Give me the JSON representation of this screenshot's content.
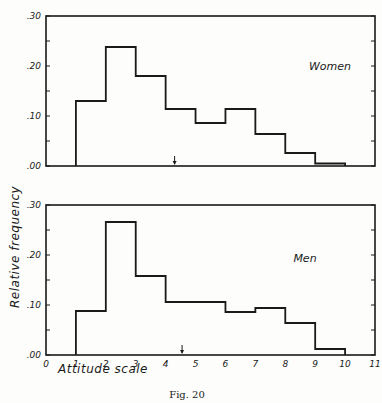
{
  "chart_data": {
    "type": "bar",
    "subtype": "step-histogram",
    "caption": "Fig. 20",
    "xlabel": "Attitude scale",
    "ylabel": "Relative frequency",
    "x_ticks": [
      "0",
      "1",
      "2",
      "3",
      "4",
      "5",
      "6",
      "7",
      "8",
      "9",
      "10",
      "11"
    ],
    "xlim": [
      0,
      11
    ],
    "y_ticks": [
      ".00",
      ".10",
      ".20",
      ".30"
    ],
    "ylim": [
      0,
      0.3
    ],
    "grid": false,
    "panels": [
      {
        "name": "Women",
        "label": "Women",
        "bin_edges": [
          1,
          2,
          3,
          4,
          5,
          6,
          7,
          8,
          9,
          10
        ],
        "values": [
          0.13,
          0.238,
          0.18,
          0.114,
          0.086,
          0.114,
          0.064,
          0.026,
          0.005
        ],
        "mean_marker_x": 4.3
      },
      {
        "name": "Men",
        "label": "Men",
        "bin_edges": [
          1,
          2,
          3,
          4,
          5,
          6,
          7,
          8,
          9,
          10
        ],
        "values": [
          0.088,
          0.266,
          0.158,
          0.106,
          0.106,
          0.086,
          0.094,
          0.064,
          0.012
        ],
        "mean_marker_x": 4.55
      }
    ]
  },
  "figure": {
    "caption": "Fig. 20",
    "xlabel": "Attitude scale",
    "ylabel": "Relative frequency",
    "panel_labels": [
      "Women",
      "Men"
    ]
  }
}
